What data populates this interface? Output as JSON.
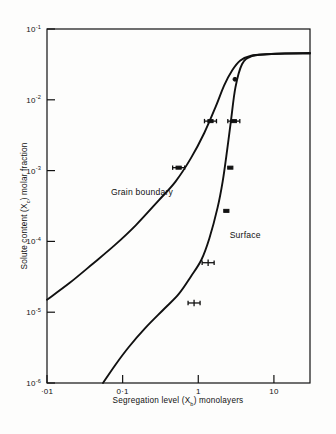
{
  "figure": {
    "background_color": "#fdfdfc",
    "ink_color": "#111111"
  },
  "axes": {
    "x_title_parts": {
      "lead": "Segregation level (X",
      "sub": "b",
      "tail": ") monolayers"
    },
    "y_title_parts": {
      "lead": "Solute content (X",
      "sub": "c",
      "tail": ") molar fraction"
    },
    "x_tick_labels": [
      "·01",
      "0·1",
      "1",
      "10"
    ],
    "y_tick_mantissa": "10",
    "y_tick_exponents": [
      "-1",
      "-2",
      "-3",
      "-4",
      "-5",
      "-6"
    ]
  },
  "annotations": {
    "grain_boundary_label": "Grain boundary",
    "surface_label": "Surface"
  },
  "chart_data": {
    "type": "line",
    "title": "",
    "subtitle": "",
    "xlabel": "Segregation level (Xb) monolayers",
    "ylabel": "Solute content (Xc) molar fraction",
    "xscale": "log",
    "yscale": "log",
    "xlim": [
      0.01,
      30
    ],
    "ylim": [
      1e-06,
      0.1
    ],
    "grid": false,
    "legend": "inline-annotations",
    "x_ticks": [
      0.01,
      0.1,
      1,
      10
    ],
    "x_ticklabels": [
      "·01",
      "0·1",
      "1",
      "10"
    ],
    "y_ticks": [
      0.1,
      0.01,
      0.001,
      0.0001,
      1e-05,
      1e-06
    ],
    "y_ticklabels": [
      "10-1",
      "10-2",
      "10-3",
      "10-4",
      "10-5",
      "10-6"
    ],
    "series": [
      {
        "name": "Grain boundary",
        "label_position": {
          "x": 0.07,
          "y": 0.00045
        },
        "x": [
          0.01,
          0.02,
          0.04,
          0.08,
          0.15,
          0.3,
          0.5,
          0.8,
          1.2,
          1.7,
          2.2,
          2.8,
          3.6,
          5.0,
          8.0,
          14.0,
          30.0
        ],
        "y": [
          1.5e-05,
          2.6e-05,
          4.8e-05,
          9e-05,
          0.00017,
          0.00038,
          0.0007,
          0.0015,
          0.0034,
          0.008,
          0.016,
          0.026,
          0.036,
          0.042,
          0.044,
          0.045,
          0.045
        ],
        "points": [
          {
            "x": 0.55,
            "y": 0.0011,
            "marker": "filled-box",
            "xerr": true
          },
          {
            "x": 1.45,
            "y": 0.005,
            "marker": "filled-box",
            "xerr": true
          }
        ]
      },
      {
        "name": "Surface",
        "label_position": {
          "x": 2.6,
          "y": 0.00011
        },
        "x": [
          0.055,
          0.08,
          0.12,
          0.2,
          0.35,
          0.55,
          0.8,
          1.1,
          1.4,
          1.8,
          2.1,
          2.4,
          2.7,
          3.1,
          3.8,
          5.0,
          8.0,
          14.0,
          30.0
        ],
        "y": [
          1e-06,
          1.8e-06,
          3.2e-06,
          6e-06,
          1.1e-05,
          1.8e-05,
          3.2e-05,
          5.5e-05,
          0.00011,
          0.0003,
          0.0007,
          0.0019,
          0.005,
          0.015,
          0.032,
          0.041,
          0.044,
          0.045,
          0.046
        ],
        "points": [
          {
            "x": 0.88,
            "y": 1.35e-05,
            "marker": "cross",
            "xerr": true
          },
          {
            "x": 1.35,
            "y": 5e-05,
            "marker": "cross",
            "xerr": true
          },
          {
            "x": 2.35,
            "y": 0.00027,
            "marker": "filled-box",
            "xerr": false
          },
          {
            "x": 2.65,
            "y": 0.0011,
            "marker": "filled-box",
            "xerr": false
          },
          {
            "x": 2.95,
            "y": 0.005,
            "marker": "filled-box",
            "xerr": true
          },
          {
            "x": 3.05,
            "y": 0.0195,
            "marker": "filled-dot",
            "xerr": false
          }
        ]
      }
    ]
  }
}
